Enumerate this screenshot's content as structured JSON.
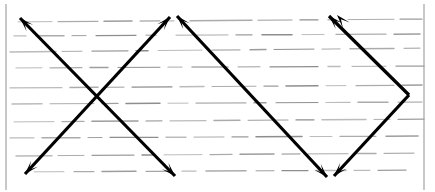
{
  "figure": {
    "type": "scanned-line-diagram",
    "canvas": {
      "width": 435,
      "height": 192
    },
    "background_color": "#ffffff",
    "ink_color": "#000000",
    "texture_color": "#6e6e6e",
    "border": {
      "name": "page-frame",
      "left_x": 6,
      "right_x": 424,
      "top_y": 4,
      "bottom_y": 190,
      "color": "#9a9a9a",
      "visible_sides": "left-and-right"
    },
    "arrow_path": {
      "style": "double-headed-zigzag",
      "stroke_width": 3.2,
      "head_length": 14,
      "head_width": 9,
      "vertices": [
        {
          "name": "top-left-tip",
          "x": 20,
          "y": 18,
          "head": true,
          "direction": "up-left"
        },
        {
          "name": "bottom-apex-1",
          "x": 175,
          "y": 176,
          "head": true,
          "direction": "down-right"
        },
        {
          "name": "top-tip-2",
          "x": 170,
          "y": 17,
          "head": true,
          "direction": "up-right"
        },
        {
          "name": "bottom-left-tip",
          "x": 25,
          "y": 174,
          "head": true,
          "direction": "down-left"
        },
        {
          "name": "top-tip-3",
          "x": 177,
          "y": 16,
          "head": true,
          "direction": "up-left"
        },
        {
          "name": "bottom-apex-2",
          "x": 327,
          "y": 177,
          "head": true,
          "direction": "down-right"
        },
        {
          "name": "top-tip-4",
          "x": 329,
          "y": 16,
          "head": true,
          "direction": "up-right"
        },
        {
          "name": "right-apex",
          "x": 409,
          "y": 95,
          "head": false,
          "direction": "right"
        },
        {
          "name": "top-tip-5",
          "x": 337,
          "y": 15,
          "head": true,
          "direction": "up-left"
        },
        {
          "name": "bottom-apex-3",
          "x": 334,
          "y": 176,
          "head": true,
          "direction": "down-right"
        }
      ],
      "segments": [
        {
          "name": "segment-1",
          "from": [
            20,
            18
          ],
          "to": [
            175,
            176
          ]
        },
        {
          "name": "segment-2",
          "from": [
            170,
            17
          ],
          "to": [
            25,
            174
          ]
        },
        {
          "name": "segment-3",
          "from": [
            177,
            16
          ],
          "to": [
            327,
            177
          ]
        },
        {
          "name": "segment-4",
          "from": [
            329,
            16
          ],
          "to": [
            409,
            95
          ]
        },
        {
          "name": "segment-5",
          "from": [
            409,
            95
          ],
          "to": [
            334,
            176
          ]
        }
      ],
      "crossings": [
        {
          "name": "crossing-left",
          "x": 95,
          "y": 95
        },
        {
          "name": "crossing-right",
          "x": 252,
          "y": 96
        }
      ]
    },
    "texture": {
      "name": "horizontal-dashed-lines",
      "description": "broken horizontal grey ruling lines, slightly sloped",
      "rows": [
        {
          "y": 22,
          "slope": -3,
          "dashes": [
            [
              18,
              34
            ],
            [
              58,
              40
            ],
            [
              104,
              28
            ],
            [
              140,
              20
            ],
            [
              168,
              6
            ],
            [
              190,
              62
            ],
            [
              258,
              34
            ],
            [
              300,
              18
            ],
            [
              328,
              8
            ],
            [
              348,
              46
            ],
            [
              400,
              22
            ]
          ]
        },
        {
          "y": 36,
          "slope": -2,
          "dashes": [
            [
              14,
              12
            ],
            [
              36,
              28
            ],
            [
              72,
              14
            ],
            [
              96,
              40
            ],
            [
              146,
              10
            ],
            [
              176,
              52
            ],
            [
              236,
              16
            ],
            [
              262,
              30
            ],
            [
              302,
              22
            ],
            [
              336,
              50
            ],
            [
              394,
              26
            ]
          ]
        },
        {
          "y": 52,
          "slope": -4,
          "dashes": [
            [
              10,
              46
            ],
            [
              62,
              20
            ],
            [
              92,
              36
            ],
            [
              136,
              12
            ],
            [
              158,
              44
            ],
            [
              212,
              28
            ],
            [
              250,
              16
            ],
            [
              274,
              40
            ],
            [
              322,
              18
            ],
            [
              350,
              44
            ],
            [
              404,
              16
            ]
          ]
        },
        {
          "y": 68,
          "slope": -2,
          "dashes": [
            [
              16,
              26
            ],
            [
              50,
              32
            ],
            [
              90,
              18
            ],
            [
              118,
              42
            ],
            [
              168,
              14
            ],
            [
              192,
              36
            ],
            [
              238,
              22
            ],
            [
              270,
              48
            ],
            [
              328,
              12
            ],
            [
              352,
              34
            ],
            [
              396,
              28
            ]
          ]
        },
        {
          "y": 88,
          "slope": -3,
          "dashes": [
            [
              10,
              52
            ],
            [
              70,
              28
            ],
            [
              106,
              18
            ],
            [
              132,
              40
            ],
            [
              180,
              24
            ],
            [
              212,
              44
            ],
            [
              264,
              14
            ],
            [
              286,
              32
            ],
            [
              326,
              20
            ],
            [
              356,
              38
            ],
            [
              402,
              20
            ]
          ]
        },
        {
          "y": 104,
          "slope": -2,
          "dashes": [
            [
              12,
              30
            ],
            [
              50,
              44
            ],
            [
              102,
              16
            ],
            [
              126,
              34
            ],
            [
              168,
              20
            ],
            [
              196,
              50
            ],
            [
              254,
              12
            ],
            [
              276,
              42
            ],
            [
              326,
              24
            ],
            [
              358,
              30
            ],
            [
              398,
              24
            ]
          ]
        },
        {
          "y": 122,
          "slope": -3,
          "dashes": [
            [
              14,
              40
            ],
            [
              62,
              22
            ],
            [
              92,
              46
            ],
            [
              146,
              16
            ],
            [
              170,
              36
            ],
            [
              214,
              26
            ],
            [
              248,
              40
            ],
            [
              296,
              18
            ],
            [
              322,
              44
            ],
            [
              374,
              16
            ],
            [
              398,
              26
            ]
          ]
        },
        {
          "y": 138,
          "slope": -2,
          "dashes": [
            [
              10,
              24
            ],
            [
              42,
              38
            ],
            [
              88,
              14
            ],
            [
              110,
              48
            ],
            [
              166,
              20
            ],
            [
              194,
              30
            ],
            [
              232,
              16
            ],
            [
              256,
              46
            ],
            [
              310,
              22
            ],
            [
              340,
              36
            ],
            [
              386,
              32
            ]
          ]
        },
        {
          "y": 156,
          "slope": -3,
          "dashes": [
            [
              16,
              36
            ],
            [
              58,
              26
            ],
            [
              92,
              42
            ],
            [
              142,
              12
            ],
            [
              164,
              38
            ],
            [
              210,
              22
            ],
            [
              240,
              34
            ],
            [
              282,
              18
            ],
            [
              308,
              40
            ],
            [
              356,
              20
            ],
            [
              384,
              30
            ]
          ]
        },
        {
          "y": 172,
          "slope": -2,
          "dashes": [
            [
              34,
              30
            ],
            [
              74,
              20
            ],
            [
              102,
              34
            ],
            [
              146,
              26
            ],
            [
              182,
              14
            ],
            [
              206,
              40
            ],
            [
              256,
              18
            ],
            [
              282,
              26
            ],
            [
              316,
              30
            ],
            [
              354,
              16
            ],
            [
              378,
              28
            ]
          ]
        }
      ]
    },
    "labels": []
  }
}
